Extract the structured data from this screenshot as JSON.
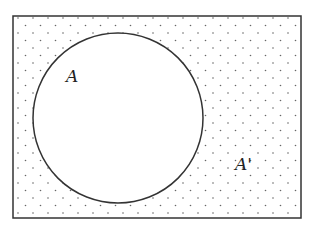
{
  "diagram": {
    "type": "venn",
    "universe": {
      "label": "A'",
      "pattern": "dotted",
      "x": 13,
      "y": 16,
      "width": 288,
      "height": 202
    },
    "set": {
      "label": "A",
      "cx": 118,
      "cy": 118,
      "r": 85,
      "fill": "#ffffff"
    },
    "colors": {
      "stroke": "#333333",
      "dot": "#666666",
      "background": "#ffffff"
    }
  }
}
